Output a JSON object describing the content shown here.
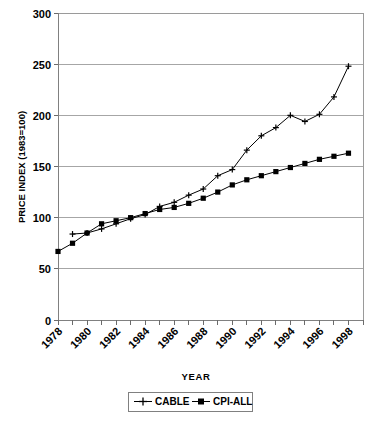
{
  "chart_data": {
    "type": "line",
    "title": "",
    "xlabel": "YEAR",
    "ylabel": "PRICE INDEX (1983=100)",
    "xlim": [
      1978,
      1999
    ],
    "ylim": [
      0,
      300
    ],
    "yticks": [
      0,
      50,
      100,
      150,
      200,
      250,
      300
    ],
    "xticks": [
      1978,
      1980,
      1982,
      1984,
      1986,
      1988,
      1990,
      1992,
      1994,
      1996,
      1998
    ],
    "x": [
      1978,
      1979,
      1980,
      1981,
      1982,
      1983,
      1984,
      1985,
      1986,
      1987,
      1988,
      1989,
      1990,
      1991,
      1992,
      1993,
      1994,
      1995,
      1996,
      1997,
      1998
    ],
    "grid": "horizontal",
    "legend_position": "bottom",
    "series": [
      {
        "name": "CABLE",
        "marker": "plus",
        "color": "#000000",
        "values": [
          null,
          84,
          85,
          89,
          94,
          99,
          103,
          111,
          115,
          122,
          128,
          141,
          147,
          166,
          180,
          188,
          200,
          194,
          201,
          218,
          248
        ]
      },
      {
        "name": "CPI-ALL",
        "marker": "square",
        "color": "#000000",
        "values": [
          67,
          75,
          85,
          94,
          97,
          100,
          104,
          108,
          110,
          114,
          119,
          125,
          132,
          137,
          141,
          145,
          149,
          153,
          157,
          160,
          163
        ]
      }
    ]
  },
  "axes": {
    "y_title": "PRICE INDEX (1983=100)",
    "x_title": "YEAR",
    "y_tick_labels": [
      "300",
      "250",
      "200",
      "150",
      "100",
      "50",
      "0"
    ],
    "x_tick_labels": [
      "1978",
      "1980",
      "1982",
      "1984",
      "1986",
      "1988",
      "1990",
      "1992",
      "1994",
      "1996",
      "1998"
    ]
  },
  "legend": {
    "items": [
      {
        "label": "CABLE",
        "marker": "plus-marker"
      },
      {
        "label": "CPI-ALL",
        "marker": "square-marker"
      }
    ]
  }
}
